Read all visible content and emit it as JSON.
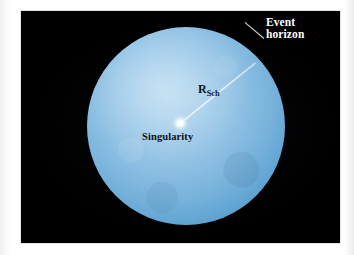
{
  "figure": {
    "type": "black-hole-schematic",
    "panel": {
      "background_color": "#000000",
      "x": 21,
      "y": 11,
      "width": 319,
      "height": 232
    },
    "page_background_color": "#ffffff"
  },
  "sphere": {
    "name": "event-horizon-sphere",
    "center_x": 186,
    "center_y": 126,
    "radius": 99,
    "fill_light_color": "#b4d7ef",
    "fill_mid_color": "#74b0da",
    "fill_edge_color": "#2f78b0"
  },
  "singularity": {
    "center_x": 180,
    "center_y": 123,
    "glow_color": "#ffffff"
  },
  "radius_line": {
    "name": "schwarzschild-radius-line",
    "from_x": 180,
    "from_y": 123,
    "to_x": 256,
    "to_y": 62,
    "color": "#ffffff"
  },
  "leader_line": {
    "name": "event-horizon-leader-line",
    "from_x": 264,
    "from_y": 38,
    "to_x": 245,
    "to_y": 22,
    "color": "#ffffff"
  },
  "labels": {
    "event_horizon": {
      "line1": "Event",
      "line2": "horizon",
      "color": "#ffffff"
    },
    "schwarzschild_radius": {
      "base": "R",
      "subscript": "Sch",
      "color": "#10161e"
    },
    "singularity": {
      "text": "Singularity",
      "color": "#0d1219"
    }
  }
}
